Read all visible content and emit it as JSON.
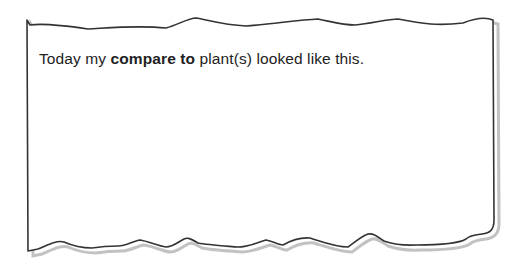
{
  "card": {
    "prompt": {
      "before": "Today my ",
      "emphasis": "compare to",
      "after": " plant(s) looked like this."
    },
    "drawing_area": ""
  },
  "colors": {
    "border": "#333333",
    "shadow": "#9a9a9a",
    "text": "#222222",
    "background": "#ffffff"
  }
}
